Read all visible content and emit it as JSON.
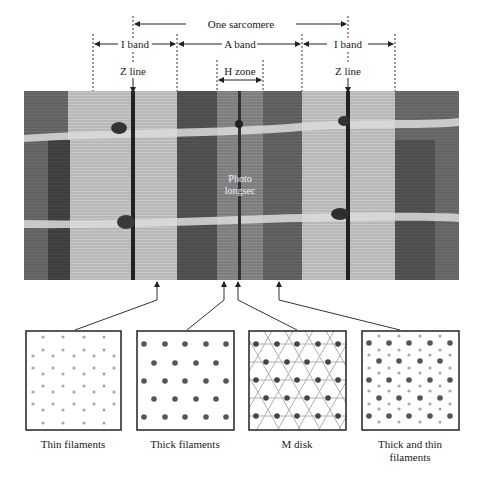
{
  "figure": {
    "dimension_labels": {
      "sarcomere": "One sarcomere",
      "i_band_left": "I band",
      "a_band": "A band",
      "i_band_right": "I band",
      "h_zone": "H zone",
      "z_line_left": "Z line",
      "z_line_right": "Z line"
    },
    "photo": {
      "overlay_line1": "Photo",
      "overlay_line2": "longsec"
    },
    "panels": [
      {
        "id": "thin",
        "caption": "Thin filaments",
        "caption_line2": ""
      },
      {
        "id": "thick",
        "caption": "Thick filaments",
        "caption_line2": ""
      },
      {
        "id": "mdisk",
        "caption": "M disk",
        "caption_line2": ""
      },
      {
        "id": "both",
        "caption": "Thick and thin",
        "caption_line2": "filaments"
      }
    ],
    "colors": {
      "thin_dot": "#a8a8a8",
      "thick_dot": "#555555",
      "lattice_line": "#b0b0b0",
      "outline": "#222222"
    }
  }
}
